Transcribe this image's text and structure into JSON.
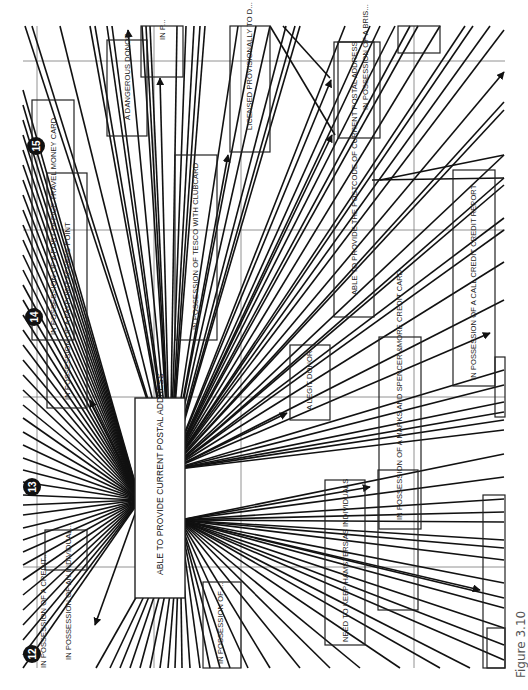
{
  "figure": {
    "caption": "Figure 3.10",
    "orientation": "rotated-90-ccw",
    "line_color": "#111111",
    "grid_color": "#777777"
  },
  "center_node": {
    "label": "ABLE TO PROVIDE CURRENT POSTAL ADDRESS"
  },
  "badges": [
    {
      "id": "badge-12",
      "number": "12"
    },
    {
      "id": "badge-13",
      "number": "13"
    },
    {
      "id": "badge-14",
      "number": "14"
    },
    {
      "id": "badge-15",
      "number": "15"
    }
  ],
  "nodes": [
    {
      "id": "node-dangerous-donor",
      "label": "A DANGEROUS DONOR"
    },
    {
      "id": "node-in-p",
      "label": "IN P..."
    },
    {
      "id": "node-licensed-provisionally",
      "label": "LICENSED PROVISIONALLY TO D..."
    },
    {
      "id": "node-money-card",
      "label": "IN POSSESSION OF A POST OFFICE TRAVEL MONEY CARD"
    },
    {
      "id": "node-access-point",
      "label": "IN POSSESSION OF A PAYPOINT ACCESS POINT"
    },
    {
      "id": "node-clubcard",
      "label": "IN POSSESSION OF TESCO WITH CLUBCARD"
    },
    {
      "id": "node-current-postcode",
      "label": "ABLE TO PROVIDE THE POSTCODE OF CURRENT POSTAL ADDRESS"
    },
    {
      "id": "node-bris",
      "label": "IN POSSESSION OF A BRIS..."
    },
    {
      "id": "node-credit-report",
      "label": "IN POSSESSION OF A CALL CREDIT CREDIT REPORT"
    },
    {
      "id": "node-legit-donor",
      "label": "A LEGIT DONOR"
    },
    {
      "id": "node-ms-card",
      "label": "IN POSSESSION OF A MARKS AND SPENCER &MORE CREDIT CARD"
    },
    {
      "id": "node-keep-hamsters",
      "label": "NEED TO KEEP HAMSTERS AS INDIVIDUALS"
    },
    {
      "id": "node-in-possession-left",
      "label": "IN POSSESSION OF AN INDIVIDUAL..."
    },
    {
      "id": "node-bottom-left",
      "label": "IN POSSESSION OF ..."
    },
    {
      "id": "node-bottom-left-2",
      "label": "IN POSSESSION OF A CREDIT..."
    }
  ]
}
